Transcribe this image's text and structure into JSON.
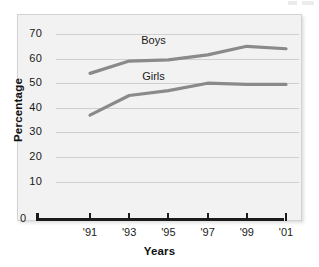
{
  "chart_data": {
    "type": "line",
    "title": "",
    "xlabel": "Years",
    "ylabel": "Percentage",
    "x": [
      "'91",
      "'93",
      "'95",
      "'97",
      "'99",
      "'01"
    ],
    "categories": [
      "'91",
      "'93",
      "'95",
      "'97",
      "'99",
      "'01"
    ],
    "series": [
      {
        "name": "Boys",
        "values": [
          54,
          59,
          59.5,
          61.5,
          65,
          64
        ],
        "color": "#8a8a8a"
      },
      {
        "name": "Girls",
        "values": [
          37,
          45,
          47,
          50,
          49.5,
          49.5
        ],
        "color": "#8a8a8a"
      }
    ],
    "ylim": [
      0,
      70
    ],
    "yticks": [
      0,
      10,
      20,
      30,
      40,
      50,
      60,
      70
    ],
    "ytick_labels": [
      "0",
      "10",
      "20",
      "30",
      "40",
      "50",
      "60",
      "70"
    ],
    "xtick_labels": [
      "'91",
      "'93",
      "'95",
      "'97",
      "'99",
      "'01"
    ],
    "grid": "horizontal",
    "legend": "inline-labels",
    "annotations": [
      {
        "text": "Boys",
        "x": "'94",
        "y": 67
      },
      {
        "text": "Girls",
        "x": "'94",
        "y": 52.5
      }
    ]
  },
  "axis": {
    "y_title": "Percentage",
    "x_title": "Years",
    "zero_label": "0"
  }
}
